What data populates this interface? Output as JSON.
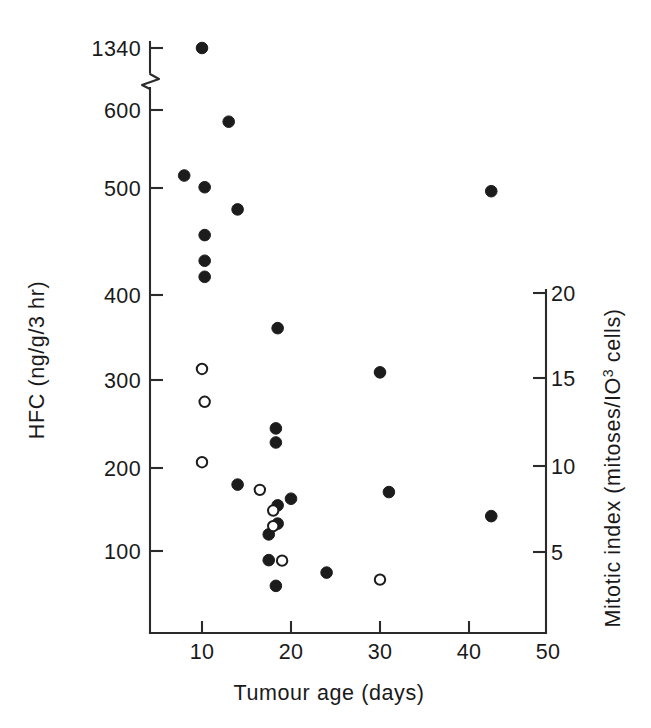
{
  "chart_data": {
    "type": "scatter",
    "title": "",
    "xlabel": "Tumour age (days)",
    "ylabel": "HFC (ng/g/3 hr)",
    "ylabel_right": "Mitotic index (mitoses/IO3 cells)",
    "ylabel_right_prefix": "Mitotic index (mitoses/IO",
    "ylabel_right_exp": "3",
    "ylabel_right_suffix": " cells)",
    "xlim": [
      0,
      50
    ],
    "xticks": [
      10,
      20,
      30,
      40,
      50
    ],
    "xtick_labels": [
      "10",
      "20",
      "30",
      "40",
      "50"
    ],
    "yticks_left": [
      100,
      200,
      300,
      400,
      500,
      600,
      1340
    ],
    "ytick_labels_left": [
      "100",
      "200",
      "300",
      "400",
      "500",
      "600",
      "1340"
    ],
    "ylim_left": [
      40,
      600
    ],
    "axis_break": true,
    "axis_break_between": [
      600,
      1340
    ],
    "yticks_right": [
      5,
      10,
      15,
      20
    ],
    "ytick_labels_right": [
      "5",
      "10",
      "15",
      "20"
    ],
    "ylim_right": [
      2,
      20
    ],
    "grid": false,
    "legend": "none",
    "series": [
      {
        "name": "HFC",
        "marker": "filled-circle",
        "color": "#1c1c1c",
        "points": [
          {
            "x": 10.0,
            "y": 1340
          },
          {
            "x": 13.0,
            "y": 585
          },
          {
            "x": 8.0,
            "y": 516
          },
          {
            "x": 10.3,
            "y": 501
          },
          {
            "x": 14.0,
            "y": 480
          },
          {
            "x": 10.3,
            "y": 456
          },
          {
            "x": 10.3,
            "y": 432
          },
          {
            "x": 10.3,
            "y": 417
          },
          {
            "x": 18.5,
            "y": 361
          },
          {
            "x": 30.0,
            "y": 309
          },
          {
            "x": 42.5,
            "y": 497
          },
          {
            "x": 18.3,
            "y": 245
          },
          {
            "x": 18.3,
            "y": 229
          },
          {
            "x": 14.0,
            "y": 180
          },
          {
            "x": 20.0,
            "y": 163
          },
          {
            "x": 31.0,
            "y": 171
          },
          {
            "x": 42.5,
            "y": 142
          },
          {
            "x": 18.5,
            "y": 155
          },
          {
            "x": 18.5,
            "y": 133
          },
          {
            "x": 17.5,
            "y": 120
          },
          {
            "x": 17.5,
            "y": 89
          },
          {
            "x": 18.3,
            "y": 58
          },
          {
            "x": 24.0,
            "y": 74
          }
        ]
      },
      {
        "name": "Mitotic index",
        "marker": "open-circle",
        "color": "#1c1c1c",
        "points": [
          {
            "x": 10.0,
            "y": 15.6
          },
          {
            "x": 10.3,
            "y": 13.7
          },
          {
            "x": 10.0,
            "y": 10.2
          },
          {
            "x": 16.5,
            "y": 8.6
          },
          {
            "x": 18.0,
            "y": 7.4
          },
          {
            "x": 18.0,
            "y": 6.5
          },
          {
            "x": 19.0,
            "y": 4.5
          },
          {
            "x": 30.0,
            "y": 3.4
          }
        ]
      }
    ]
  },
  "axes": {
    "left_title": "HFC (ng/g/3 hr)",
    "bottom_title": "Tumour age (days)"
  }
}
